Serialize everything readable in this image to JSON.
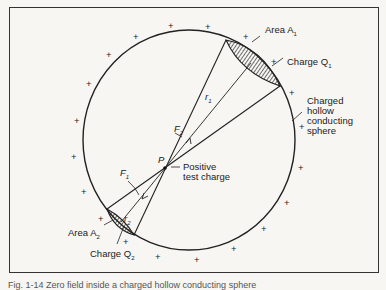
{
  "figure": {
    "labels": {
      "area_a1": "Area A",
      "area_a1_sub": "1",
      "charge_q1": "Charge Q",
      "charge_q1_sub": "1",
      "sphere_line1": "Charged",
      "sphere_line2": "hollow",
      "sphere_line3": "conducting",
      "sphere_line4": "sphere",
      "f2": "F",
      "f2_sub": "2",
      "r1": "r",
      "r1_sub": "1",
      "p": "P",
      "test_line1": "Positive",
      "test_line2": "test charge",
      "f1": "F",
      "f1_sub": "1",
      "r2": "r",
      "r2_sub": "2",
      "area_a2": "Area A",
      "area_a2_sub": "2",
      "charge_q2": "Charge Q",
      "charge_q2_sub": "2",
      "plus": "+"
    },
    "caption": "Fig. 1-14 Zero field inside a charged hollow conducting sphere"
  }
}
